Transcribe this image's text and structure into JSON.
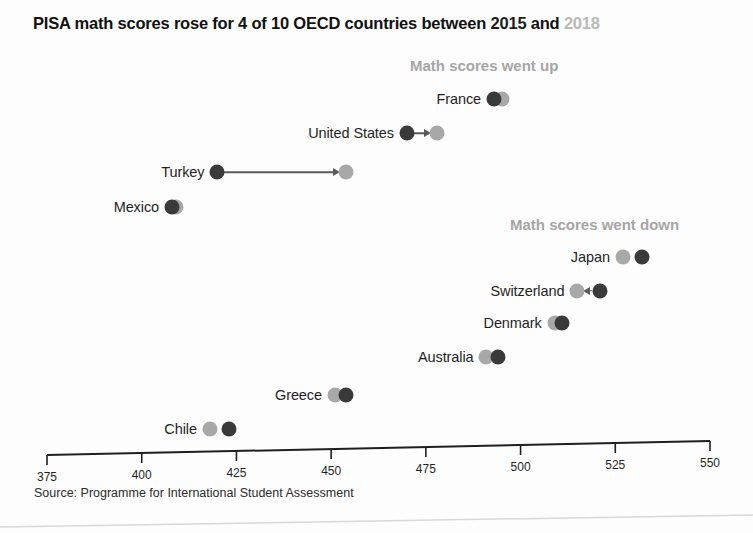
{
  "title": {
    "before_start_year": "PISA math scores rose for 4 of 10 OECD countries between ",
    "start_year": "2015",
    "conjunction": " and ",
    "end_year": "2018",
    "full": "PISA math scores rose for 4 of 10 OECD countries between 2015 and 2018"
  },
  "captions": {
    "up": "Math scores went up",
    "down": "Math scores went down"
  },
  "source": "Source: Programme for International Student Assessment",
  "colors": {
    "start_dot": "#3a3a3a",
    "end_dot": "#a8a8a8",
    "caption": "#a6a6a6",
    "axis": "#1f1f1f",
    "connector": "#5a5a5a"
  },
  "axis_ticks": [
    {
      "label": "375",
      "value": 375
    },
    {
      "label": "400",
      "value": 400
    },
    {
      "label": "425",
      "value": 425
    },
    {
      "label": "450",
      "value": 450
    },
    {
      "label": "475",
      "value": 475
    },
    {
      "label": "500",
      "value": 500
    },
    {
      "label": "525",
      "value": 525
    },
    {
      "label": "550",
      "value": 550
    }
  ],
  "chart_data": {
    "type": "scatter",
    "subtype": "dumbbell",
    "title": "PISA math scores rose for 4 of 10 OECD countries between 2015 and 2018",
    "xlabel": "",
    "ylabel": "",
    "xlim": [
      375,
      550
    ],
    "grid": false,
    "legend": [
      "2015",
      "2018"
    ],
    "legend_position": "title-inline",
    "annotations": [
      "Math scores went up",
      "Math scores went down"
    ],
    "series": [
      {
        "name": "2015",
        "color": "#3a3a3a"
      },
      {
        "name": "2018",
        "color": "#a8a8a8"
      }
    ],
    "categories": [
      "France",
      "United States",
      "Turkey",
      "Mexico",
      "Japan",
      "Switzerland",
      "Denmark",
      "Australia",
      "Greece",
      "Chile"
    ],
    "points": [
      {
        "country": "France",
        "group": "up",
        "v2015": 493,
        "v2018": 495,
        "row_y": 98
      },
      {
        "country": "United States",
        "group": "up",
        "v2015": 470,
        "v2018": 478,
        "row_y": 130
      },
      {
        "country": "Turkey",
        "group": "up",
        "v2015": 420,
        "v2018": 454,
        "row_y": 166
      },
      {
        "country": "Mexico",
        "group": "up",
        "v2015": 408,
        "v2018": 409,
        "row_y": 199
      },
      {
        "country": "Japan",
        "group": "down",
        "v2015": 532,
        "v2018": 527,
        "row_y": 258
      },
      {
        "country": "Switzerland",
        "group": "down",
        "v2015": 521,
        "v2018": 515,
        "row_y": 291
      },
      {
        "country": "Denmark",
        "group": "down",
        "v2015": 511,
        "v2018": 509,
        "row_y": 323
      },
      {
        "country": "Australia",
        "group": "down",
        "v2015": 494,
        "v2018": 491,
        "row_y": 355
      },
      {
        "country": "Greece",
        "group": "down",
        "v2015": 454,
        "v2018": 451,
        "row_y": 390
      },
      {
        "country": "Chile",
        "group": "down",
        "v2015": 423,
        "v2018": 418,
        "row_y": 422
      }
    ]
  }
}
